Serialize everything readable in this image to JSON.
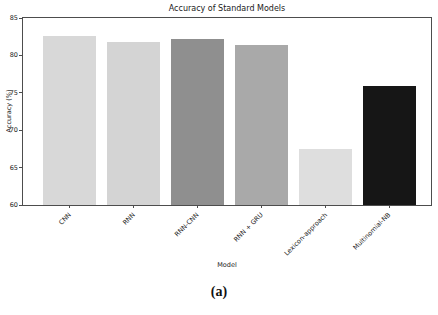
{
  "figure": {
    "caption": "(a)"
  },
  "chart_data": {
    "type": "bar",
    "title": "Accuracy of Standard Models",
    "xlabel": "Model",
    "ylabel": "Accuracy (%)",
    "categories": [
      "CNN",
      "RNN",
      "RNN-CNN",
      "RNN + GRU",
      "Lexicon-approach",
      "Multinomial-NB"
    ],
    "values": [
      82.6,
      81.8,
      82.2,
      81.4,
      67.5,
      75.9
    ],
    "bar_colors": [
      "#d8d8d8",
      "#d4d4d4",
      "#8f8f8f",
      "#a9a9a9",
      "#dedede",
      "#161616"
    ],
    "ylim": [
      60,
      85
    ],
    "yticks": [
      60,
      65,
      70,
      75,
      80,
      85
    ],
    "grid": false,
    "legend": "none",
    "xticklabel_rotation_deg": 45
  }
}
